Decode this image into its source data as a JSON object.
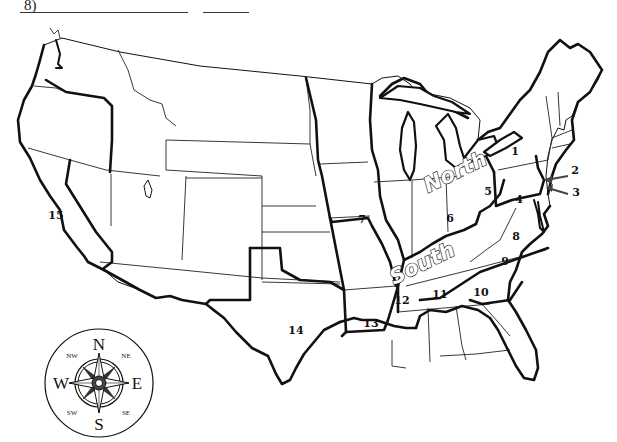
{
  "worksheet": {
    "question_number": "8)",
    "answer_blanks": [
      "",
      ""
    ]
  },
  "map": {
    "title": "United States outline map with numbered states",
    "region_labels": {
      "north": "North",
      "south": "South"
    },
    "state_numbers": [
      {
        "id": 1,
        "label": "1",
        "state": "Pennsylvania"
      },
      {
        "id": 2,
        "label": "2",
        "state": "New Jersey"
      },
      {
        "id": 3,
        "label": "3",
        "state": "Delaware"
      },
      {
        "id": 4,
        "label": "4",
        "state": "Virginia"
      },
      {
        "id": 5,
        "label": "5",
        "state": "West Virginia"
      },
      {
        "id": 6,
        "label": "6",
        "state": "Kentucky"
      },
      {
        "id": 7,
        "label": "7",
        "state": "Missouri"
      },
      {
        "id": 8,
        "label": "8",
        "state": "North Carolina"
      },
      {
        "id": 9,
        "label": "9",
        "state": "South Carolina"
      },
      {
        "id": 10,
        "label": "10",
        "state": "Georgia"
      },
      {
        "id": 11,
        "label": "11",
        "state": "Alabama"
      },
      {
        "id": 12,
        "label": "12",
        "state": "Mississippi"
      },
      {
        "id": 13,
        "label": "13",
        "state": "Louisiana"
      },
      {
        "id": 14,
        "label": "14",
        "state": "Texas"
      },
      {
        "id": 15,
        "label": "15",
        "state": "California"
      }
    ]
  },
  "compass": {
    "n": "N",
    "s": "S",
    "e": "E",
    "w": "W",
    "ne": "NE",
    "nw": "NW",
    "se": "SE",
    "sw": "SW"
  },
  "colors": {
    "ink": "#111111",
    "paper": "#ffffff"
  }
}
